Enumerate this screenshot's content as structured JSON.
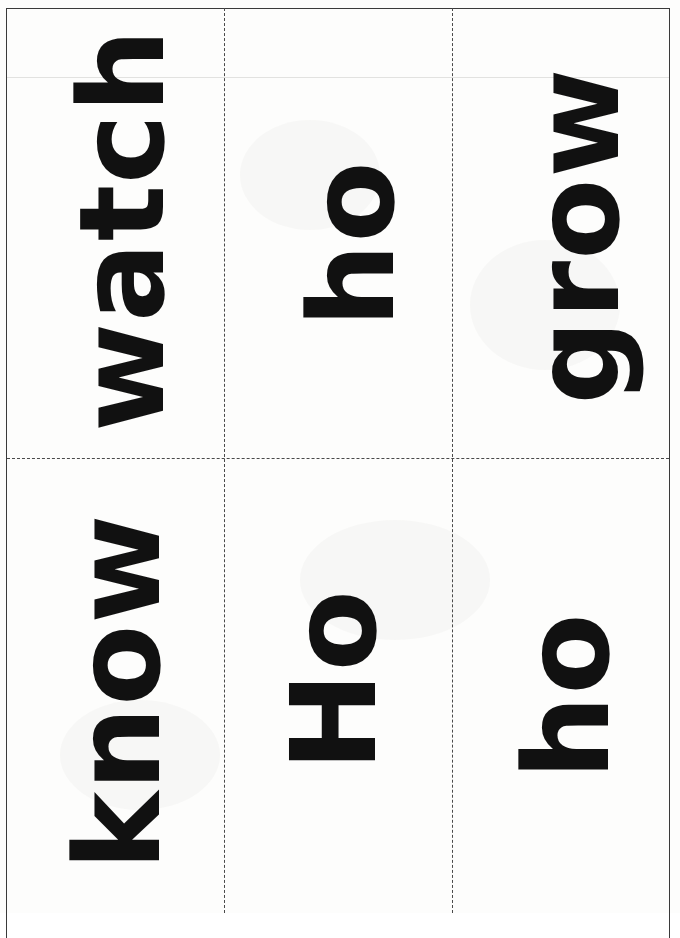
{
  "document": {
    "kind": "scanned-worksheet",
    "description": "Scanned flashcard sheet with six cut-apart word cards",
    "background_color": "#fdfdfc",
    "ink_color": "#111111",
    "frame_color": "#3a3a3a",
    "cut_line_color": "#4a4a4a"
  },
  "grid": {
    "rows": 2,
    "columns": 3,
    "cards": [
      {
        "id": "card-1",
        "word": "watch",
        "row": 1,
        "column": 1,
        "rotation": "-90deg"
      },
      {
        "id": "card-2",
        "word": "ho",
        "row": 1,
        "column": 2,
        "rotation": "-90deg"
      },
      {
        "id": "card-3",
        "word": "grow",
        "row": 1,
        "column": 3,
        "rotation": "-90deg"
      },
      {
        "id": "card-4",
        "word": "know",
        "row": 2,
        "column": 1,
        "rotation": "-90deg"
      },
      {
        "id": "card-5",
        "word": "Ho",
        "row": 2,
        "column": 2,
        "rotation": "-90deg"
      },
      {
        "id": "card-6",
        "word": "ho",
        "row": 2,
        "column": 3,
        "rotation": "-90deg"
      }
    ]
  }
}
